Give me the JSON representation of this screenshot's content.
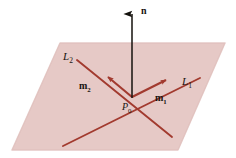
{
  "figure": {
    "background_color": "#ffffff",
    "plane": {
      "name": "plane",
      "fill_color": "#e6c9c6",
      "edge_color": "#d9b7b4",
      "corners": "60,43 225,43 178,150 12,150"
    },
    "normal_vector": {
      "label": "n",
      "color": "#14110d",
      "from": "132,97",
      "to": "132,6"
    },
    "lines": [
      {
        "id": "L1",
        "label": "L",
        "subscript": "1",
        "color": "#a23a2f",
        "from": "63,146",
        "to": "200,78"
      },
      {
        "id": "L2",
        "label": "L",
        "subscript": "2",
        "color": "#a23a2f",
        "from": "77,60",
        "to": "172,137"
      }
    ],
    "direction_vectors": [
      {
        "id": "m1",
        "label": "m",
        "subscript": "1",
        "color": "#a23a2f",
        "from": "132,97",
        "to": "168,79"
      },
      {
        "id": "m2",
        "label": "m",
        "subscript": "2",
        "color": "#a23a2f",
        "from": "132,97",
        "to": "105,75"
      }
    ],
    "point": {
      "label": "P",
      "subscript": "0",
      "x": "132",
      "y": "97"
    },
    "labels": {
      "normal": "n",
      "line1": "L",
      "line1_sub": "1",
      "line2": "L",
      "line2_sub": "2",
      "vec1": "m",
      "vec1_sub": "1",
      "vec2": "m",
      "vec2_sub": "2",
      "point": "P",
      "point_sub": "0"
    }
  }
}
